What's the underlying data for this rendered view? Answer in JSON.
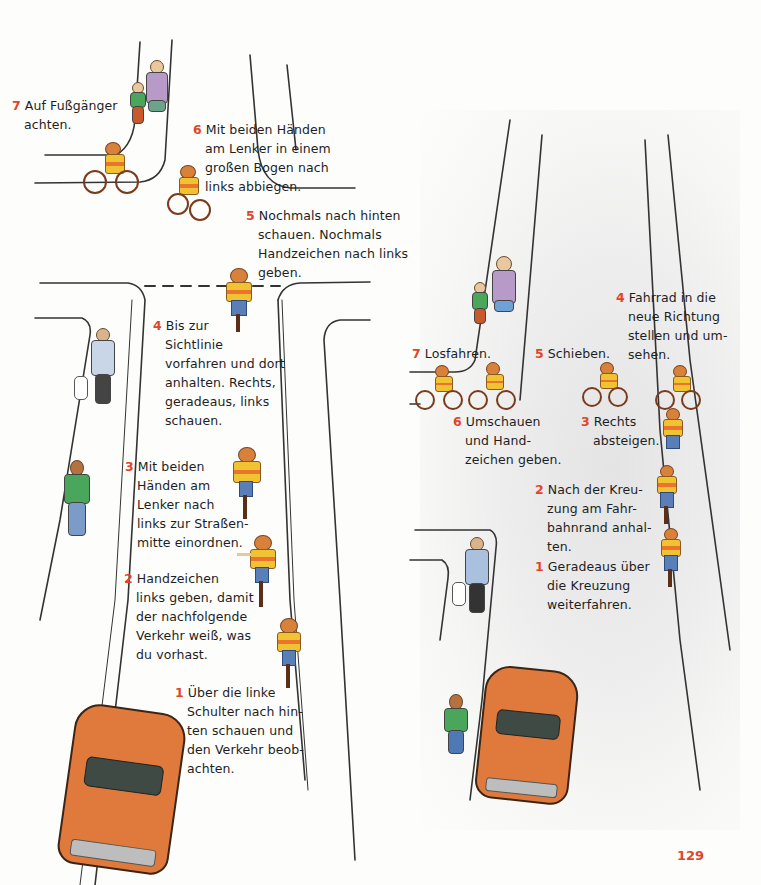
{
  "page": {
    "number": "129",
    "accent_color": "#e0452b",
    "text_color": "#1e1e1e"
  },
  "left_diagram": {
    "title": "Indirect left turn at intersection (direct turn, step sequence)",
    "steps": [
      {
        "num": "1",
        "text": "Über die linke\nSchulter nach hin-\nten schauen und\nden Verkehr beob-\nachten."
      },
      {
        "num": "2",
        "text": "Handzeichen\nlinks geben, damit\nder nachfolgende\nVerkehr weiß, was\ndu vorhast."
      },
      {
        "num": "3",
        "text": "Mit beiden\nHänden am\nLenker nach\nlinks zur Straßen-\nmitte einordnen."
      },
      {
        "num": "4",
        "text": "Bis zur\nSichtlinie\nvorfahren und dort\nanhalten. Rechts,\ngeradeaus, links\nschauen."
      },
      {
        "num": "5",
        "text": "Nochmals nach hinten\nschauen. Nochmals\nHandzeichen nach links\ngeben."
      },
      {
        "num": "6",
        "text": "Mit beiden Händen\nam Lenker in einem\ngroßen Bogen nach\nlinks abbiegen."
      },
      {
        "num": "7",
        "text": "Auf Fußgänger\nachten."
      }
    ]
  },
  "right_diagram": {
    "steps": [
      {
        "num": "1",
        "text": "Geradeaus über\ndie Kreuzung\nweiterfahren."
      },
      {
        "num": "2",
        "text": "Nach der Kreu-\nzung am Fahr-\nbahnrand anhal-\nten."
      },
      {
        "num": "3",
        "text": "Rechts\nabsteigen."
      },
      {
        "num": "4",
        "text": "Fahrrad in die\nneue Richtung\nstellen und um-\nsehen."
      },
      {
        "num": "5",
        "text": "Schieben."
      },
      {
        "num": "6",
        "text": "Umschauen\nund Hand-\nzeichen geben."
      },
      {
        "num": "7",
        "text": "Losfahren."
      }
    ]
  },
  "icons": {
    "cyclist": "cyclist-icon",
    "car": "car-icon",
    "pedestrian": "pedestrian-icon",
    "dog": "dog-icon"
  }
}
